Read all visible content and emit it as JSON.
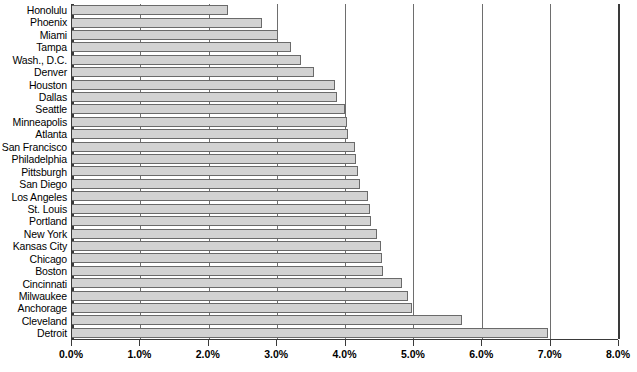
{
  "chart_data": {
    "type": "bar",
    "orientation": "horizontal",
    "title": "",
    "subtitle": "",
    "xlabel": "",
    "ylabel": "",
    "xlim": [
      0,
      8
    ],
    "ylim": null,
    "grid": true,
    "legend": null,
    "legend_position": "none",
    "x_tick_labels": [
      "0.0%",
      "1.0%",
      "2.0%",
      "3.0%",
      "4.0%",
      "5.0%",
      "6.0%",
      "7.0%",
      "8.0%"
    ],
    "x_tick_values": [
      0,
      1,
      2,
      3,
      4,
      5,
      6,
      7,
      8
    ],
    "categories": [
      "Honolulu",
      "Phoenix",
      "Miami",
      "Tampa",
      "Wash., D.C.",
      "Denver",
      "Houston",
      "Dallas",
      "Seattle",
      "Minneapolis",
      "Atlanta",
      "San Francisco",
      "Philadelphia",
      "Pittsburgh",
      "San Diego",
      "Los Angeles",
      "St. Louis",
      "Portland",
      "New York",
      "Kansas City",
      "Chicago",
      "Boston",
      "Cincinnati",
      "Milwaukee",
      "Anchorage",
      "Cleveland",
      "Detroit"
    ],
    "values": [
      2.28,
      2.79,
      3.02,
      3.21,
      3.36,
      3.54,
      3.85,
      3.88,
      4.0,
      4.03,
      4.04,
      4.15,
      4.16,
      4.19,
      4.22,
      4.34,
      4.37,
      4.38,
      4.47,
      4.53,
      4.54,
      4.56,
      4.84,
      4.92,
      4.98,
      5.71,
      6.97
    ],
    "value_unit": "%",
    "bar_color": "#d2d2d2",
    "bar_border_color": "#6a6a6a",
    "axis_color": "#3a3a3a",
    "gridline_color": "#6e6e6e"
  }
}
